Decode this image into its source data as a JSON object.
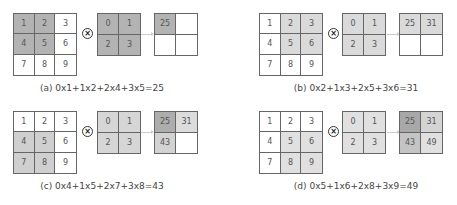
{
  "panels": [
    {
      "id": "a",
      "caption": "(a) 0x1+1x2+2x4+3x5=25",
      "input": [
        "1",
        "2",
        "3",
        "4",
        "5",
        "6",
        "7",
        "8",
        "9"
      ],
      "input_colors": [
        "#b3b3b3",
        "#b3b3b3",
        "#ffffff",
        "#b3b3b3",
        "#b3b3b3",
        "#ffffff",
        "#ffffff",
        "#ffffff",
        "#ffffff"
      ],
      "kernel": [
        "0",
        "1",
        "2",
        "3"
      ],
      "kernel_color": "#b3b3b3",
      "output": [
        "25",
        "",
        "",
        ""
      ],
      "output_colors": [
        "#b3b3b3",
        "#ffffff",
        "#ffffff",
        "#ffffff"
      ]
    },
    {
      "id": "b",
      "caption": "(b) 0x2+1x3+2x5+3x6=31",
      "input": [
        "1",
        "2",
        "3",
        "4",
        "5",
        "6",
        "7",
        "8",
        "9"
      ],
      "input_colors": [
        "#ffffff",
        "#dadada",
        "#dadada",
        "#ffffff",
        "#dadada",
        "#dadada",
        "#ffffff",
        "#ffffff",
        "#ffffff"
      ],
      "kernel": [
        "0",
        "1",
        "2",
        "3"
      ],
      "kernel_color": "#dadada",
      "output": [
        "25",
        "31",
        "",
        ""
      ],
      "output_colors": [
        "#dadada",
        "#dadada",
        "#ffffff",
        "#ffffff"
      ]
    },
    {
      "id": "c",
      "caption": "(c) 0x4+1x5+2x7+3x8=43",
      "input": [
        "1",
        "2",
        "3",
        "4",
        "5",
        "6",
        "7",
        "8",
        "9"
      ],
      "input_colors": [
        "#ffffff",
        "#ffffff",
        "#ffffff",
        "#cfcfcf",
        "#cfcfcf",
        "#ffffff",
        "#cfcfcf",
        "#cfcfcf",
        "#ffffff"
      ],
      "kernel": [
        "0",
        "1",
        "2",
        "3"
      ],
      "kernel_color": "#d6d6d6",
      "output": [
        "25",
        "31",
        "43",
        ""
      ],
      "output_colors": [
        "#adadad",
        "#dcdcdc",
        "#d2d2d2",
        "#ffffff"
      ]
    },
    {
      "id": "d",
      "caption": "(d) 0x5+1x6+2x8+3x9=49",
      "input": [
        "1",
        "2",
        "3",
        "4",
        "5",
        "6",
        "7",
        "8",
        "9"
      ],
      "input_colors": [
        "#ffffff",
        "#ffffff",
        "#ffffff",
        "#ffffff",
        "#e0e0e0",
        "#e0e0e0",
        "#ffffff",
        "#e0e0e0",
        "#e0e0e0"
      ],
      "kernel": [
        "0",
        "1",
        "2",
        "3"
      ],
      "kernel_color": "#e0e0e0",
      "output": [
        "25",
        "31",
        "43",
        "49"
      ],
      "output_colors": [
        "#a8a8a8",
        "#d4d4d4",
        "#c4c4c4",
        "#e0e0e0"
      ]
    }
  ],
  "operator_symbol": "×"
}
